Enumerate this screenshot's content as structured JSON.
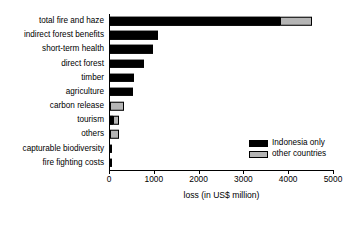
{
  "chart_data": {
    "type": "bar",
    "orientation": "horizontal",
    "stacked": true,
    "title": "",
    "xlabel": "loss (in US$ million)",
    "ylabel": "",
    "xlim": [
      0,
      5000
    ],
    "xticks": [
      0,
      1000,
      2000,
      3000,
      4000,
      5000
    ],
    "xtick_labels": [
      "0",
      "1000",
      "2000",
      "3000",
      "4000",
      "5000"
    ],
    "grid": false,
    "legend_position": "lower right",
    "categories": [
      "total fire and haze",
      "indirect forest benefits",
      "short-term health",
      "direct forest",
      "timber",
      "agriculture",
      "carbon release",
      "tourism",
      "others",
      "capturable biodiversity",
      "fire fighting costs"
    ],
    "series": [
      {
        "name": "Indonesia only",
        "color": "#000000",
        "values": [
          3800,
          1070,
          950,
          750,
          540,
          520,
          0,
          70,
          0,
          30,
          20
        ]
      },
      {
        "name": "other countries",
        "color": "#b5b5b5",
        "values": [
          700,
          0,
          0,
          0,
          0,
          0,
          320,
          120,
          200,
          0,
          0
        ]
      }
    ],
    "totals": [
      4500,
      1070,
      950,
      750,
      540,
      520,
      320,
      190,
      200,
      30,
      20
    ]
  },
  "legend": {
    "items": [
      {
        "label": "Indonesia only",
        "swatch": "black"
      },
      {
        "label": "other countries",
        "swatch": "gray"
      }
    ]
  }
}
